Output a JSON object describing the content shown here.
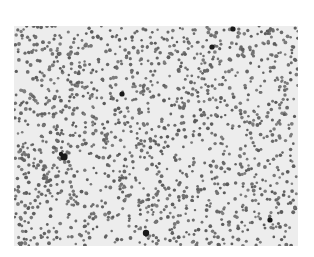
{
  "image": {
    "description": "Grayscale micrograph of densely scattered small round particles/cells",
    "background_color": "#ededed",
    "dot_color": "#6e6e6e",
    "dark_color": "#1a1a1a",
    "frame": {
      "x": 14,
      "y": 26,
      "width": 284,
      "height": 220
    },
    "dot_count": 1500,
    "dot_radius": 1.5,
    "seed": 20240,
    "dark_particles": [
      {
        "x": 50,
        "y": 131,
        "r": 3.6
      },
      {
        "x": 47,
        "y": 128,
        "r": 2.2
      },
      {
        "x": 219,
        "y": 3,
        "r": 2.6
      },
      {
        "x": 198,
        "y": 21,
        "r": 2.6
      },
      {
        "x": 132,
        "y": 207,
        "r": 3.2
      },
      {
        "x": 108,
        "y": 68,
        "r": 2.6
      },
      {
        "x": 256,
        "y": 194,
        "r": 2.6
      }
    ]
  }
}
